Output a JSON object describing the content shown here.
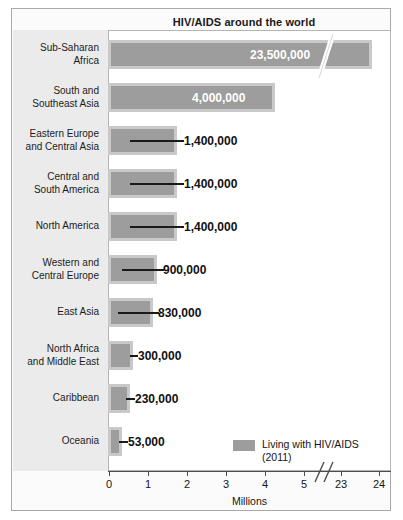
{
  "chart": {
    "title": "HIV/AIDS around the world",
    "xlabel": "Millions",
    "legend": {
      "swatch_color": "#9d9d9d",
      "line1": "Living with HIV/AIDS",
      "line2": "(2011)"
    },
    "tick_labels": [
      "0",
      "1",
      "2",
      "3",
      "4",
      "5",
      "23",
      "24"
    ]
  },
  "chart_data": {
    "type": "bar",
    "orientation": "horizontal",
    "title": "HIV/AIDS around the world",
    "xlabel": "Millions",
    "ylabel": "",
    "axis_break": true,
    "axis_break_between": [
      5,
      23
    ],
    "xlim": [
      0,
      24
    ],
    "xticks": [
      0,
      1,
      2,
      3,
      4,
      5,
      23,
      24
    ],
    "grid": false,
    "legend_position": "inside-bottom-right",
    "series": [
      {
        "name": "Living with HIV/AIDS (2011)",
        "color": "#9d9d9d",
        "values": [
          23500000,
          4000000,
          1400000,
          1400000,
          1400000,
          900000,
          830000,
          300000,
          230000,
          53000
        ]
      }
    ],
    "categories": [
      "Sub-Saharan Africa",
      "South and Southeast Asia",
      "Eastern Europe and Central Asia",
      "Central and South America",
      "North America",
      "Western and Central Europe",
      "East Asia",
      "North Africa and Middle East",
      "Caribbean",
      "Oceania"
    ],
    "rows": [
      {
        "label_lines": [
          "Sub-Saharan",
          "Africa"
        ],
        "value": 23500000,
        "value_label": "23,500,000",
        "label_inside": true,
        "bar_end_px": 360,
        "value_x_px": 238,
        "leader_x_px": 0,
        "leader_w_px": 0,
        "value_out_x_px": 0,
        "has_break": true,
        "break_x_px": 299
      },
      {
        "label_lines": [
          "South and",
          "Southeast Asia"
        ],
        "value": 4000000,
        "value_label": "4,000,000",
        "label_inside": true,
        "bar_end_px": 263,
        "value_x_px": 180,
        "leader_x_px": 0,
        "leader_w_px": 0,
        "value_out_x_px": 0,
        "has_break": false,
        "break_x_px": 0
      },
      {
        "label_lines": [
          "Eastern Europe",
          "and Central Asia"
        ],
        "value": 1400000,
        "value_label": "1,400,000",
        "label_inside": false,
        "bar_end_px": 165,
        "value_x_px": 0,
        "leader_x_px": 118,
        "leader_w_px": 54,
        "value_out_x_px": 172,
        "has_break": false,
        "break_x_px": 0
      },
      {
        "label_lines": [
          "Central and",
          "South America"
        ],
        "value": 1400000,
        "value_label": "1,400,000",
        "label_inside": false,
        "bar_end_px": 165,
        "value_x_px": 0,
        "leader_x_px": 118,
        "leader_w_px": 54,
        "value_out_x_px": 172,
        "has_break": false,
        "break_x_px": 0
      },
      {
        "label_lines": [
          "North America"
        ],
        "value": 1400000,
        "value_label": "1,400,000",
        "label_inside": false,
        "bar_end_px": 165,
        "value_x_px": 0,
        "leader_x_px": 118,
        "leader_w_px": 54,
        "value_out_x_px": 172,
        "has_break": false,
        "break_x_px": 0
      },
      {
        "label_lines": [
          "Western and",
          "Central Europe"
        ],
        "value": 900000,
        "value_label": "900,000",
        "label_inside": false,
        "bar_end_px": 145,
        "value_x_px": 0,
        "leader_x_px": 110,
        "leader_w_px": 42,
        "value_out_x_px": 151,
        "has_break": false,
        "break_x_px": 0
      },
      {
        "label_lines": [
          "East Asia"
        ],
        "value": 830000,
        "value_label": "830,000",
        "label_inside": false,
        "bar_end_px": 141,
        "value_x_px": 0,
        "leader_x_px": 106,
        "leader_w_px": 41,
        "value_out_x_px": 146,
        "has_break": false,
        "break_x_px": 0
      },
      {
        "label_lines": [
          "North Africa",
          "and Middle East"
        ],
        "value": 300000,
        "value_label": "300,000",
        "label_inside": false,
        "bar_end_px": 121,
        "value_x_px": 0,
        "leader_x_px": 118,
        "leader_w_px": 8,
        "value_out_x_px": 126,
        "has_break": false,
        "break_x_px": 0
      },
      {
        "label_lines": [
          "Caribbean"
        ],
        "value": 230000,
        "value_label": "230,000",
        "label_inside": false,
        "bar_end_px": 118,
        "value_x_px": 0,
        "leader_x_px": 114,
        "leader_w_px": 9,
        "value_out_x_px": 123,
        "has_break": false,
        "break_x_px": 0
      },
      {
        "label_lines": [
          "Oceania"
        ],
        "value": 53000,
        "value_label": "53,000",
        "label_inside": false,
        "bar_end_px": 110,
        "value_x_px": 0,
        "leader_x_px": 107,
        "leader_w_px": 9,
        "value_out_x_px": 116,
        "has_break": false,
        "break_x_px": 0
      }
    ],
    "ticks_px": [
      {
        "label": "0",
        "x": 97
      },
      {
        "label": "1",
        "x": 136
      },
      {
        "label": "2",
        "x": 175
      },
      {
        "label": "3",
        "x": 214
      },
      {
        "label": "4",
        "x": 253
      },
      {
        "label": "5",
        "x": 292
      },
      {
        "label": "23",
        "x": 329
      },
      {
        "label": "24",
        "x": 367
      }
    ]
  }
}
